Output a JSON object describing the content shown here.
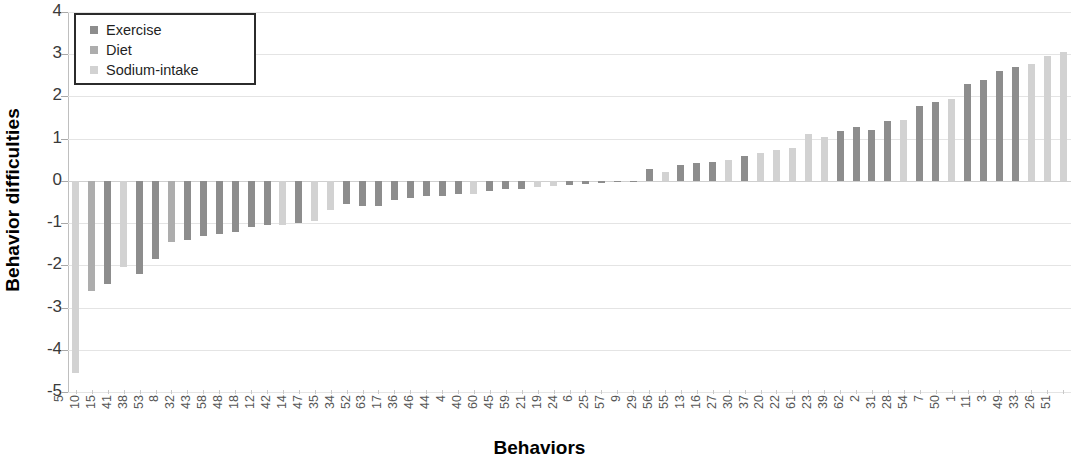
{
  "chart_data": {
    "type": "bar",
    "title": "",
    "xlabel": "Behaviors",
    "ylabel": "Behavior difficulties",
    "ylim": [
      -5,
      4
    ],
    "yticks": [
      4,
      3,
      2,
      1,
      0,
      -1,
      -2,
      -3,
      -4,
      -5
    ],
    "grid": true,
    "legend_position": "top-left",
    "legend": [
      {
        "name": "Exercise",
        "color": "#8d8d8d"
      },
      {
        "name": "Diet",
        "color": "#adadad"
      },
      {
        "name": "Sodium-intake",
        "color": "#d2d2d2"
      }
    ],
    "categories": [
      "5",
      "10",
      "15",
      "41",
      "38",
      "53",
      "8",
      "32",
      "43",
      "58",
      "48",
      "18",
      "12",
      "42",
      "14",
      "47",
      "35",
      "34",
      "52",
      "63",
      "17",
      "36",
      "46",
      "44",
      "4",
      "40",
      "60",
      "45",
      "59",
      "21",
      "19",
      "24",
      "6",
      "25",
      "57",
      "9",
      "29",
      "56",
      "55",
      "13",
      "16",
      "27",
      "30",
      "37",
      "20",
      "22",
      "61",
      "23",
      "39",
      "62",
      "2",
      "31",
      "28",
      "54",
      "7",
      "50",
      "1",
      "11",
      "3",
      "49",
      "33",
      "26",
      "51"
    ],
    "values": [
      -4.55,
      -2.6,
      -2.45,
      -2.05,
      -2.2,
      -1.85,
      -1.45,
      -1.4,
      -1.3,
      -1.25,
      -1.2,
      -1.1,
      -1.05,
      -1.05,
      -1.0,
      -0.95,
      -0.7,
      -0.55,
      -0.6,
      -0.6,
      -0.45,
      -0.4,
      -0.35,
      -0.35,
      -0.3,
      -0.3,
      -0.25,
      -0.2,
      -0.2,
      -0.15,
      -0.12,
      -0.1,
      -0.08,
      -0.05,
      -0.03,
      -0.02,
      0.28,
      0.2,
      0.38,
      0.42,
      0.45,
      0.5,
      0.6,
      0.65,
      0.72,
      0.78,
      1.1,
      1.05,
      1.18,
      1.28,
      1.2,
      1.42,
      1.45,
      1.78,
      1.88,
      1.95,
      2.3,
      2.4,
      2.6,
      2.7,
      2.78,
      2.95,
      3.05
    ],
    "series_index": [
      2,
      1,
      0,
      2,
      0,
      0,
      1,
      0,
      0,
      0,
      0,
      0,
      0,
      2,
      0,
      2,
      2,
      0,
      0,
      0,
      0,
      0,
      0,
      0,
      0,
      2,
      0,
      0,
      0,
      2,
      2,
      0,
      0,
      0,
      0,
      0,
      0,
      2,
      0,
      0,
      0,
      2,
      0,
      2,
      2,
      2,
      2,
      2,
      0,
      0,
      0,
      0,
      2,
      0,
      0,
      2,
      0,
      0,
      0,
      0,
      2,
      2,
      2
    ],
    "series_names": [
      "Exercise",
      "Diet",
      "Sodium-intake"
    ],
    "n_bars": 63
  }
}
